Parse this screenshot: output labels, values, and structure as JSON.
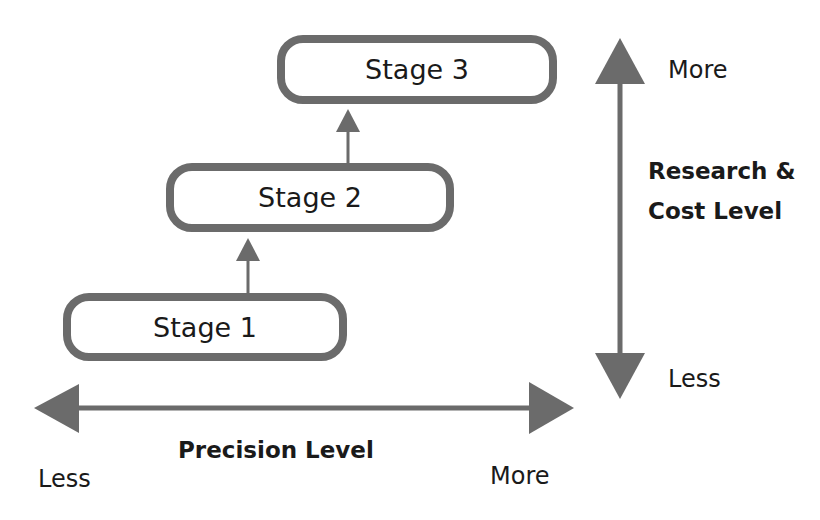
{
  "diagram": {
    "stages": [
      {
        "label": "Stage 1"
      },
      {
        "label": "Stage 2"
      },
      {
        "label": "Stage 3"
      }
    ],
    "vertical_axis": {
      "title_line1": "Research &",
      "title_line2": "Cost Level",
      "top_label": "More",
      "bottom_label": "Less"
    },
    "horizontal_axis": {
      "title": "Precision Level",
      "left_label": "Less",
      "right_label": "More"
    },
    "colors": {
      "stroke": "#6b6b6b",
      "text": "#1a1a1a",
      "background": "#ffffff"
    }
  }
}
